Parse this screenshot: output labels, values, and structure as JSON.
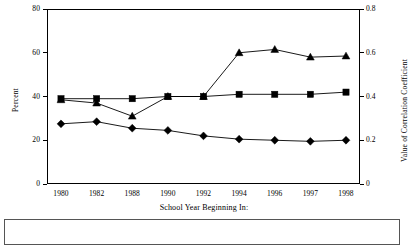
{
  "chart_data": {
    "type": "line",
    "title": "",
    "xlabel": "School Year Beginning In:",
    "ylabel": "Percent",
    "y2label": "Value of Correlation Coefficient",
    "categories": [
      "1980",
      "1982",
      "1988",
      "1990",
      "1992",
      "1994",
      "1996",
      "1997",
      "1998"
    ],
    "ylim": [
      0,
      80
    ],
    "yticks": [
      0,
      20,
      40,
      60,
      80
    ],
    "ytick_labels": [
      "0",
      "20",
      "40",
      "60",
      "80"
    ],
    "y2lim": [
      0,
      0.8
    ],
    "y2ticks": [
      0,
      0.2,
      0.4,
      0.6,
      0.8
    ],
    "y2tick_labels": [
      "0",
      "0.2",
      "0.4",
      "0.6",
      "0.8"
    ],
    "grid": false,
    "legend_position": "bottom",
    "legend_entries": [],
    "series": [
      {
        "name": "series-square",
        "marker": "square",
        "axis": "left",
        "values": [
          39,
          39,
          39,
          40,
          40,
          41,
          41,
          41,
          42
        ]
      },
      {
        "name": "series-triangle",
        "marker": "triangle",
        "axis": "left",
        "values": [
          38.5,
          37,
          31,
          40,
          40,
          60,
          61.5,
          58,
          58.5
        ]
      },
      {
        "name": "series-diamond",
        "marker": "diamond",
        "axis": "left",
        "values": [
          27.5,
          28.5,
          25.5,
          24.5,
          22,
          20.5,
          20,
          19.5,
          20
        ]
      }
    ]
  },
  "axes": {
    "left_title": "Percent",
    "right_title": "Value of Correlation Coefficient",
    "bottom_title": "School Year Beginning In:"
  },
  "legend": {
    "text": ""
  }
}
